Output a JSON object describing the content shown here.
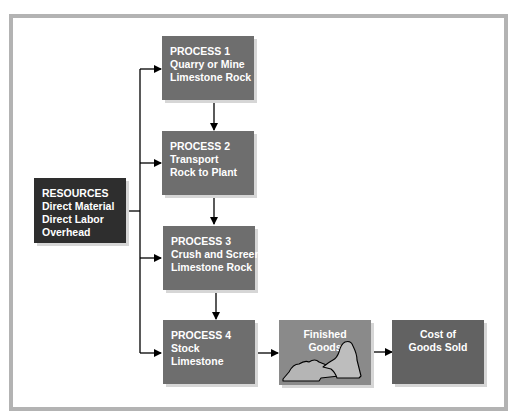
{
  "diagram": {
    "title": "",
    "colors": {
      "frame": "#b3b3b3",
      "process_box": "#6e6e6e",
      "resources_box": "#2e2e2e",
      "finished_goods_box": "#8a8a8a",
      "cogs_box": "#626262",
      "rock_fill": "#b5b5b5",
      "arrow": "#000000",
      "text": "#ffffff"
    },
    "resources": {
      "lines": [
        "RESOURCES",
        "Direct Material",
        "Direct Labor",
        "Overhead"
      ]
    },
    "processes": [
      {
        "lines": [
          "PROCESS 1",
          "Quarry or Mine",
          "Limestone Rock"
        ]
      },
      {
        "lines": [
          "PROCESS 2",
          "Transport",
          "Rock to Plant"
        ]
      },
      {
        "lines": [
          "PROCESS 3",
          "Crush and Screen",
          "Limestone Rock"
        ]
      },
      {
        "lines": [
          "PROCESS 4",
          "Stock",
          "Limestone"
        ]
      }
    ],
    "finished_goods": {
      "lines": [
        "Finished",
        "Goods"
      ],
      "icon": "rock-pile-icon"
    },
    "cost_of_goods_sold": {
      "lines": [
        "Cost of",
        "Goods Sold"
      ]
    },
    "flows": [
      {
        "from": "RESOURCES",
        "to": "PROCESS 1"
      },
      {
        "from": "RESOURCES",
        "to": "PROCESS 2"
      },
      {
        "from": "RESOURCES",
        "to": "PROCESS 3"
      },
      {
        "from": "RESOURCES",
        "to": "PROCESS 4"
      },
      {
        "from": "PROCESS 1",
        "to": "PROCESS 2"
      },
      {
        "from": "PROCESS 2",
        "to": "PROCESS 3"
      },
      {
        "from": "PROCESS 3",
        "to": "PROCESS 4"
      },
      {
        "from": "PROCESS 4",
        "to": "Finished Goods"
      },
      {
        "from": "Finished Goods",
        "to": "Cost of Goods Sold"
      }
    ]
  }
}
